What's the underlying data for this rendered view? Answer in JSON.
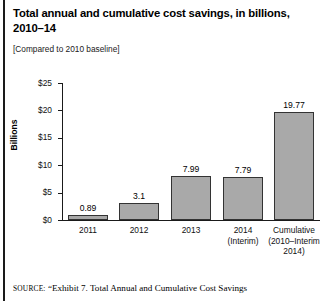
{
  "title": "Total annual and cumulative cost savings, in billions, 2010–14",
  "subtitle": "[Compared to 2010 baseline]",
  "source": {
    "prefix": "SOURCE:",
    "text": "“Exhibit 7. Total Annual and Cumulative Cost Savings"
  },
  "colors": {
    "bar_fill": "#a9a9a9",
    "bar_edge": "#333333",
    "axis": "#1a1a1a",
    "text": "#111111"
  },
  "chart_data": {
    "type": "bar",
    "title": "Total annual and cumulative cost savings, in billions, 2010–14",
    "subtitle": "[Compared to 2010 baseline]",
    "xlabel": "",
    "ylabel": "Billions",
    "ylim": [
      0,
      25
    ],
    "ytick_values": [
      0,
      5,
      10,
      15,
      20,
      25
    ],
    "ytick_labels": [
      "$0",
      "$5",
      "$10",
      "$15",
      "$20",
      "$25"
    ],
    "grid": false,
    "legend": false,
    "categories": [
      "2011",
      "2012",
      "2013",
      "2014 (Interim)",
      "Cumulative (2010–Interim 2014)"
    ],
    "category_lines": [
      [
        "2011"
      ],
      [
        "2012"
      ],
      [
        "2013"
      ],
      [
        "2014",
        "(Interim)"
      ],
      [
        "Cumulative",
        "(2010–Interim",
        "2014)"
      ]
    ],
    "values": [
      0.89,
      3.1,
      7.99,
      7.79,
      19.77
    ],
    "value_labels": [
      "0.89",
      "3.1",
      "7.99",
      "7.79",
      "19.77"
    ]
  }
}
